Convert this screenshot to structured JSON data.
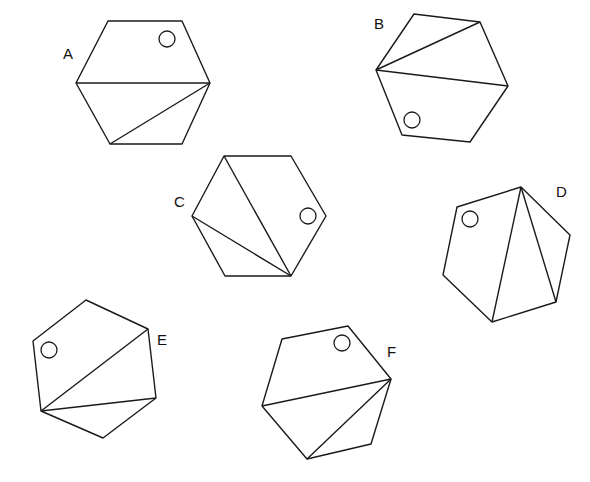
{
  "figure": {
    "width": 590,
    "height": 482,
    "stroke_color": "#1a1a1a",
    "background": "#ffffff",
    "shapes": [
      {
        "label": "A",
        "label_pos": [
          63,
          59
        ],
        "vertices": [
          [
            108,
            21
          ],
          [
            182,
            21
          ],
          [
            210,
            83
          ],
          [
            182,
            144
          ],
          [
            110,
            144
          ],
          [
            76,
            83
          ]
        ],
        "diagonals": [
          [
            [
              76,
              83
            ],
            [
              210,
              83
            ]
          ],
          [
            [
              210,
              83
            ],
            [
              110,
              144
            ]
          ]
        ],
        "circle": {
          "cx": 167,
          "cy": 39,
          "r": 8
        }
      },
      {
        "label": "B",
        "label_pos": [
          374,
          29
        ],
        "vertices": [
          [
            414,
            14
          ],
          [
            480,
            22
          ],
          [
            508,
            86
          ],
          [
            470,
            142
          ],
          [
            402,
            135
          ],
          [
            376,
            70
          ]
        ],
        "diagonals": [
          [
            [
              376,
              70
            ],
            [
              480,
              22
            ]
          ],
          [
            [
              376,
              70
            ],
            [
              508,
              86
            ]
          ]
        ],
        "circle": {
          "cx": 412,
          "cy": 120,
          "r": 8
        }
      },
      {
        "label": "C",
        "label_pos": [
          174,
          207
        ],
        "vertices": [
          [
            224,
            156
          ],
          [
            291,
            156
          ],
          [
            326,
            216
          ],
          [
            291,
            276
          ],
          [
            225,
            276
          ],
          [
            192,
            216
          ]
        ],
        "diagonals": [
          [
            [
              291,
              276
            ],
            [
              224,
              156
            ]
          ],
          [
            [
              291,
              276
            ],
            [
              192,
              216
            ]
          ]
        ],
        "circle": {
          "cx": 308,
          "cy": 216,
          "r": 8
        }
      },
      {
        "label": "D",
        "label_pos": [
          556,
          197
        ],
        "vertices": [
          [
            521,
            187
          ],
          [
            570,
            235
          ],
          [
            556,
            302
          ],
          [
            492,
            322
          ],
          [
            443,
            275
          ],
          [
            457,
            207
          ]
        ],
        "diagonals": [
          [
            [
              521,
              187
            ],
            [
              492,
              322
            ]
          ],
          [
            [
              521,
              187
            ],
            [
              556,
              302
            ]
          ]
        ],
        "circle": {
          "cx": 470,
          "cy": 219,
          "r": 8
        }
      },
      {
        "label": "E",
        "label_pos": [
          157,
          345
        ],
        "vertices": [
          [
            86,
            300
          ],
          [
            148,
            329
          ],
          [
            156,
            398
          ],
          [
            103,
            438
          ],
          [
            41,
            411
          ],
          [
            33,
            341
          ]
        ],
        "diagonals": [
          [
            [
              41,
              411
            ],
            [
              148,
              329
            ]
          ],
          [
            [
              41,
              411
            ],
            [
              156,
              398
            ]
          ]
        ],
        "circle": {
          "cx": 49,
          "cy": 350,
          "r": 8
        }
      },
      {
        "label": "F",
        "label_pos": [
          387,
          357
        ],
        "vertices": [
          [
            282,
            339
          ],
          [
            348,
            326
          ],
          [
            391,
            379
          ],
          [
            371,
            444
          ],
          [
            307,
            459
          ],
          [
            262,
            406
          ]
        ],
        "diagonals": [
          [
            [
              391,
              379
            ],
            [
              262,
              406
            ]
          ],
          [
            [
              391,
              379
            ],
            [
              307,
              459
            ]
          ]
        ],
        "circle": {
          "cx": 342,
          "cy": 343,
          "r": 8
        }
      }
    ]
  }
}
